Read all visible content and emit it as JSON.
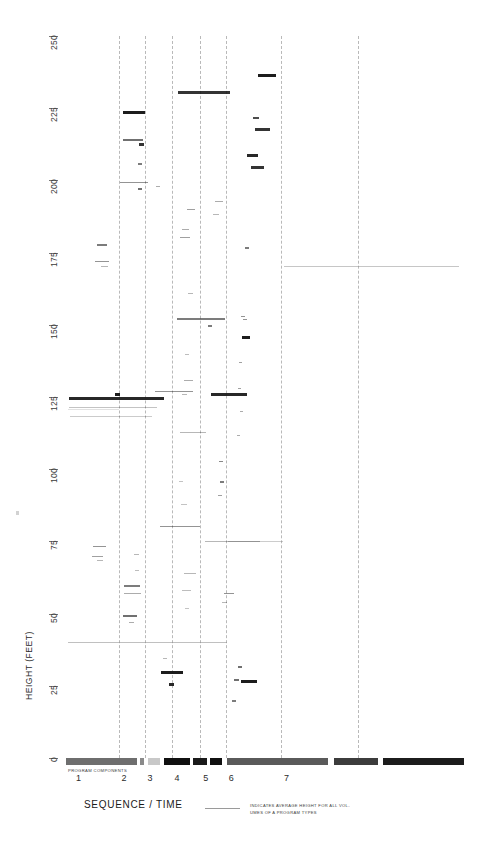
{
  "axes": {
    "y_title": "HEIGHT (FEET)",
    "y_ticks": [
      "250",
      "225",
      "200",
      "175",
      "150",
      "125",
      "100",
      "75",
      "50",
      "25",
      "0"
    ],
    "y_values": [
      250,
      225,
      200,
      175,
      150,
      125,
      100,
      75,
      50,
      25,
      0
    ],
    "x_title": "SEQUENCE / TIME",
    "x_ticks": [
      "1",
      "2",
      "3",
      "4",
      "5",
      "6",
      "7"
    ],
    "strip_label": "PROGRAM COMPONENTS"
  },
  "legend": {
    "line1": "INDICATES  AVERAGE  HEIGHT  FOR  ALL  VOL-",
    "line2": "UMES OF A PROGRAM TYPES"
  },
  "chart_data": {
    "type": "scatter",
    "title": "",
    "xlabel": "SEQUENCE / TIME",
    "ylabel": "HEIGHT (FEET)",
    "ylim": [
      0,
      250
    ],
    "xlim": [
      0.55,
      7.9
    ],
    "grid": "vertical dashed at category boundaries",
    "legend_position": "below-axis-center",
    "category_boundaries": [
      1.52,
      2.0,
      2.5,
      3.03,
      3.5,
      4.52,
      5.95
    ],
    "categories": [
      "1",
      "2",
      "3",
      "4",
      "5",
      "6",
      "7"
    ],
    "marks": [
      {
        "x": 0.6,
        "y": 125.0,
        "w": 95,
        "weight": 0.9
      },
      {
        "x": 0.6,
        "y": 121.5,
        "w": 88,
        "weight": 0.25
      },
      {
        "x": 0.62,
        "y": 118.5,
        "w": 82,
        "weight": 0.22
      },
      {
        "x": 1.45,
        "y": 126.5,
        "w": 5,
        "weight": 0.95
      },
      {
        "x": 1.12,
        "y": 178.0,
        "w": 10,
        "weight": 0.55
      },
      {
        "x": 1.08,
        "y": 172.0,
        "w": 14,
        "weight": 0.45
      },
      {
        "x": 1.2,
        "y": 170.5,
        "w": 7,
        "weight": 0.3
      },
      {
        "x": 1.05,
        "y": 73.5,
        "w": 13,
        "weight": 0.45
      },
      {
        "x": 1.03,
        "y": 70.0,
        "w": 11,
        "weight": 0.4
      },
      {
        "x": 1.13,
        "y": 68.5,
        "w": 6,
        "weight": 0.3
      },
      {
        "x": 1.6,
        "y": 224.0,
        "w": 22,
        "weight": 0.95
      },
      {
        "x": 1.6,
        "y": 214.5,
        "w": 20,
        "weight": 0.6
      },
      {
        "x": 1.9,
        "y": 213.0,
        "w": 5,
        "weight": 0.85
      },
      {
        "x": 1.88,
        "y": 206.0,
        "w": 4,
        "weight": 0.55
      },
      {
        "x": 1.55,
        "y": 199.5,
        "w": 28,
        "weight": 0.45
      },
      {
        "x": 1.88,
        "y": 197.5,
        "w": 4,
        "weight": 0.6
      },
      {
        "x": 1.62,
        "y": 60.0,
        "w": 16,
        "weight": 0.55
      },
      {
        "x": 1.62,
        "y": 57.0,
        "w": 17,
        "weight": 0.35
      },
      {
        "x": 1.6,
        "y": 49.5,
        "w": 14,
        "weight": 0.6
      },
      {
        "x": 1.72,
        "y": 47.0,
        "w": 5,
        "weight": 0.35
      },
      {
        "x": 1.8,
        "y": 70.5,
        "w": 5,
        "weight": 0.3
      },
      {
        "x": 1.82,
        "y": 65.0,
        "w": 4,
        "weight": 0.28
      },
      {
        "x": 2.22,
        "y": 198.0,
        "w": 4,
        "weight": 0.35
      },
      {
        "x": 2.2,
        "y": 127.0,
        "w": 38,
        "weight": 0.45
      },
      {
        "x": 2.28,
        "y": 80.5,
        "w": 40,
        "weight": 0.45
      },
      {
        "x": 2.3,
        "y": 30.0,
        "w": 22,
        "weight": 0.95
      },
      {
        "x": 2.45,
        "y": 26.0,
        "w": 5,
        "weight": 0.9
      },
      {
        "x": 2.34,
        "y": 34.5,
        "w": 4,
        "weight": 0.3
      },
      {
        "x": 2.62,
        "y": 231.0,
        "w": 52,
        "weight": 0.85
      },
      {
        "x": 2.78,
        "y": 190.0,
        "w": 8,
        "weight": 0.4
      },
      {
        "x": 2.7,
        "y": 183.0,
        "w": 7,
        "weight": 0.35
      },
      {
        "x": 2.66,
        "y": 180.5,
        "w": 10,
        "weight": 0.4
      },
      {
        "x": 2.8,
        "y": 161.0,
        "w": 5,
        "weight": 0.3
      },
      {
        "x": 2.6,
        "y": 152.5,
        "w": 48,
        "weight": 0.55
      },
      {
        "x": 2.74,
        "y": 140.0,
        "w": 4,
        "weight": 0.28
      },
      {
        "x": 2.72,
        "y": 131.0,
        "w": 9,
        "weight": 0.35
      },
      {
        "x": 2.7,
        "y": 126.0,
        "w": 5,
        "weight": 0.3
      },
      {
        "x": 2.66,
        "y": 113.0,
        "w": 26,
        "weight": 0.3
      },
      {
        "x": 2.64,
        "y": 96.0,
        "w": 4,
        "weight": 0.25
      },
      {
        "x": 2.68,
        "y": 88.0,
        "w": 6,
        "weight": 0.25
      },
      {
        "x": 2.72,
        "y": 64.0,
        "w": 12,
        "weight": 0.3
      },
      {
        "x": 2.7,
        "y": 58.0,
        "w": 9,
        "weight": 0.28
      },
      {
        "x": 2.74,
        "y": 52.0,
        "w": 4,
        "weight": 0.25
      },
      {
        "x": 3.22,
        "y": 126.5,
        "w": 36,
        "weight": 0.9
      },
      {
        "x": 3.3,
        "y": 193.0,
        "w": 8,
        "weight": 0.35
      },
      {
        "x": 3.26,
        "y": 188.5,
        "w": 6,
        "weight": 0.3
      },
      {
        "x": 3.18,
        "y": 150.0,
        "w": 4,
        "weight": 0.55
      },
      {
        "x": 3.38,
        "y": 103.0,
        "w": 4,
        "weight": 0.5
      },
      {
        "x": 3.4,
        "y": 96.0,
        "w": 4,
        "weight": 0.55
      },
      {
        "x": 3.36,
        "y": 91.0,
        "w": 4,
        "weight": 0.4
      },
      {
        "x": 3.46,
        "y": 57.0,
        "w": 10,
        "weight": 0.45
      },
      {
        "x": 3.44,
        "y": 54.0,
        "w": 5,
        "weight": 0.3
      },
      {
        "x": 3.12,
        "y": 75.0,
        "w": 55,
        "weight": 0.3
      },
      {
        "x": 4.1,
        "y": 237.0,
        "w": 18,
        "weight": 0.95
      },
      {
        "x": 4.0,
        "y": 222.0,
        "w": 6,
        "weight": 0.75
      },
      {
        "x": 4.04,
        "y": 218.0,
        "w": 15,
        "weight": 0.85
      },
      {
        "x": 3.9,
        "y": 209.0,
        "w": 11,
        "weight": 0.9
      },
      {
        "x": 3.96,
        "y": 205.0,
        "w": 13,
        "weight": 0.85
      },
      {
        "x": 3.86,
        "y": 177.0,
        "w": 4,
        "weight": 0.55
      },
      {
        "x": 3.78,
        "y": 153.0,
        "w": 4,
        "weight": 0.45
      },
      {
        "x": 3.82,
        "y": 152.0,
        "w": 4,
        "weight": 0.45
      },
      {
        "x": 3.8,
        "y": 146.0,
        "w": 8,
        "weight": 0.95
      },
      {
        "x": 3.74,
        "y": 137.0,
        "w": 3,
        "weight": 0.4
      },
      {
        "x": 3.72,
        "y": 128.0,
        "w": 3,
        "weight": 0.4
      },
      {
        "x": 3.76,
        "y": 120.0,
        "w": 3,
        "weight": 0.35
      },
      {
        "x": 3.7,
        "y": 112.0,
        "w": 3,
        "weight": 0.35
      },
      {
        "x": 3.72,
        "y": 32.0,
        "w": 4,
        "weight": 0.6
      },
      {
        "x": 3.66,
        "y": 27.5,
        "w": 5,
        "weight": 0.6
      },
      {
        "x": 3.78,
        "y": 27.0,
        "w": 16,
        "weight": 0.95
      },
      {
        "x": 3.62,
        "y": 20.0,
        "w": 4,
        "weight": 0.55
      }
    ],
    "average_lines": [
      {
        "y": 40.0,
        "x0": 0.58,
        "x1": 3.52,
        "weight": 0.55
      },
      {
        "y": 75.0,
        "x0": 3.55,
        "x1": 4.55,
        "weight": 0.45
      },
      {
        "y": 170.5,
        "x0": 4.58,
        "x1": 7.8,
        "weight": 0.5
      },
      {
        "y": 121.0,
        "x0": 0.58,
        "x1": 1.52,
        "weight": 0.25
      }
    ],
    "strip_segments": [
      {
        "x0": 0.0,
        "x1": 0.455,
        "shade": "#6e6e6e"
      },
      {
        "x0": 0.455,
        "x1": 0.475,
        "shade": "#ffffff"
      },
      {
        "x0": 0.475,
        "x1": 0.5,
        "shade": "#8a8a8a"
      },
      {
        "x0": 0.5,
        "x1": 0.525,
        "shade": "#ffffff"
      },
      {
        "x0": 0.525,
        "x1": 0.6,
        "shade": "#c8c8c8"
      },
      {
        "x0": 0.6,
        "x1": 0.625,
        "shade": "#ffffff"
      },
      {
        "x0": 0.625,
        "x1": 0.795,
        "shade": "#101010"
      },
      {
        "x0": 0.795,
        "x1": 0.815,
        "shade": "#ffffff"
      },
      {
        "x0": 0.815,
        "x1": 0.905,
        "shade": "#1a1a1a"
      },
      {
        "x0": 0.905,
        "x1": 0.925,
        "shade": "#ffffff"
      },
      {
        "x0": 0.925,
        "x1": 1.0,
        "shade": "#101010"
      },
      {
        "x0": 1.0,
        "x1": 1.03,
        "shade": "#ffffff"
      },
      {
        "x0": 1.03,
        "x1": 1.68,
        "shade": "#5a5a5a"
      },
      {
        "x0": 1.68,
        "x1": 1.72,
        "shade": "#ffffff"
      },
      {
        "x0": 1.72,
        "x1": 2.0,
        "shade": "#3c3c3c"
      },
      {
        "x0": 2.0,
        "x1": 2.03,
        "shade": "#ffffff"
      },
      {
        "x0": 2.03,
        "x1": 2.55,
        "shade": "#1c1c1c"
      }
    ]
  }
}
